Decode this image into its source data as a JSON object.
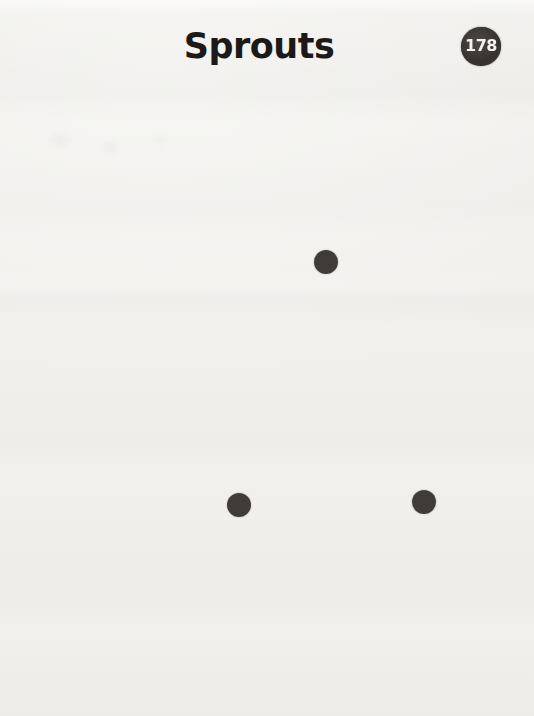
{
  "page": {
    "title": "Sprouts",
    "page_number": "178",
    "colors": {
      "paper": "#f4f3f0",
      "ink": "#1b1a18",
      "dot": "#3e3b38",
      "badge": "#37342f",
      "badge_text": "#f3f2ef"
    },
    "spots": [
      {
        "id": "spot-1",
        "x": 326,
        "y": 262,
        "r": 12
      },
      {
        "id": "spot-2",
        "x": 239,
        "y": 505,
        "r": 12
      },
      {
        "id": "spot-3",
        "x": 424,
        "y": 502,
        "r": 12
      }
    ]
  }
}
